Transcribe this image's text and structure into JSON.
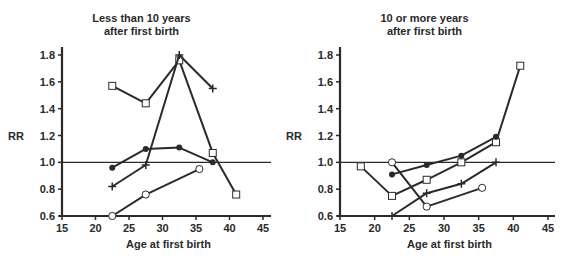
{
  "chart_data": [
    {
      "type": "line",
      "title": "Less than 10 years after first birth",
      "title_lines": [
        "Less than 10 years",
        "after first birth"
      ],
      "xlabel": "Age at first birth",
      "ylabel": "RR",
      "xlim": [
        15,
        45
      ],
      "ylim": [
        0.6,
        1.8
      ],
      "xticks": [
        15,
        20,
        25,
        30,
        35,
        40,
        45
      ],
      "yticks": [
        0.6,
        0.8,
        1.0,
        1.2,
        1.4,
        1.6,
        1.8
      ],
      "reference_line": 1.0,
      "grid": false,
      "legend": null,
      "series": [
        {
          "name": "open-square",
          "marker": "square-open",
          "x": [
            22.5,
            27.5,
            32.5,
            37.5,
            41
          ],
          "y": [
            1.57,
            1.44,
            1.76,
            1.07,
            0.76
          ]
        },
        {
          "name": "plus",
          "marker": "plus",
          "x": [
            22.5,
            27.5,
            32.5,
            37.5
          ],
          "y": [
            0.82,
            0.98,
            1.8,
            1.55
          ]
        },
        {
          "name": "filled-circle",
          "marker": "circle-filled",
          "x": [
            22.5,
            27.5,
            32.5,
            37.5
          ],
          "y": [
            0.96,
            1.1,
            1.11,
            1.0
          ]
        },
        {
          "name": "open-circle",
          "marker": "circle-open",
          "x": [
            22.5,
            27.5,
            35.5
          ],
          "y": [
            0.6,
            0.76,
            0.95
          ]
        }
      ]
    },
    {
      "type": "line",
      "title": "10 or more years after first birth",
      "title_lines": [
        "10 or more years",
        "after first birth"
      ],
      "xlabel": "Age at first birth",
      "ylabel": "RR",
      "xlim": [
        15,
        45
      ],
      "ylim": [
        0.6,
        1.8
      ],
      "xticks": [
        15,
        20,
        25,
        30,
        35,
        40,
        45
      ],
      "yticks": [
        0.6,
        0.8,
        1.0,
        1.2,
        1.4,
        1.6,
        1.8
      ],
      "reference_line": 1.0,
      "grid": false,
      "legend": null,
      "series": [
        {
          "name": "open-square",
          "marker": "square-open",
          "x": [
            18,
            22.5,
            27.5,
            32.5,
            37.5,
            41
          ],
          "y": [
            0.97,
            0.75,
            0.87,
            1.0,
            1.15,
            1.72
          ]
        },
        {
          "name": "filled-circle",
          "marker": "circle-filled",
          "x": [
            22.5,
            27.5,
            32.5,
            37.5
          ],
          "y": [
            0.91,
            0.98,
            1.05,
            1.19
          ]
        },
        {
          "name": "plus",
          "marker": "plus",
          "x": [
            22.5,
            27.5,
            32.5,
            37.5
          ],
          "y": [
            0.6,
            0.77,
            0.84,
            1.0
          ]
        },
        {
          "name": "open-circle",
          "marker": "circle-open",
          "x": [
            22.5,
            27.5,
            35.5
          ],
          "y": [
            1.0,
            0.67,
            0.81
          ]
        }
      ]
    }
  ],
  "colors": {
    "ink": "#2a2a2a",
    "background": "#ffffff"
  },
  "geometry": [
    {
      "x0": 62,
      "x1": 263,
      "y0": 216,
      "y1": 55,
      "axis_right": 271
    },
    {
      "x0": 57,
      "x1": 265,
      "y0": 216,
      "y1": 55,
      "axis_right": 272
    }
  ]
}
